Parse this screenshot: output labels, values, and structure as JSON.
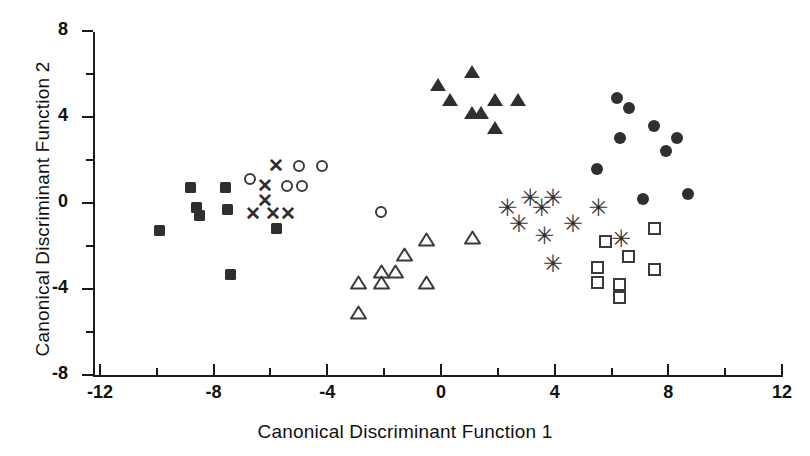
{
  "chart_data": {
    "type": "scatter",
    "title": "",
    "xlabel": "Canonical Discriminant Function 1",
    "ylabel": "Canonical Discriminant Function 2",
    "xlim": [
      -12,
      12
    ],
    "ylim": [
      -8,
      8
    ],
    "xticks": [
      -12,
      -8,
      -4,
      0,
      4,
      8,
      12
    ],
    "xticklabels": [
      "-12",
      "-8",
      "-4",
      "0",
      "4",
      "8",
      "12"
    ],
    "xminorticks": [
      -10,
      -6,
      -2,
      2,
      6,
      10
    ],
    "yticks": [
      8,
      4,
      0,
      -4,
      -8
    ],
    "yticklabels": [
      "8",
      "4",
      "0",
      "-4",
      "-8"
    ],
    "yminorticks": [
      6,
      2,
      -2,
      -6
    ],
    "grid": false,
    "legend": false,
    "series": [
      {
        "name": "Group 1",
        "marker": "filled-square",
        "points": [
          [
            -9.9,
            -1.3
          ],
          [
            -8.8,
            0.7
          ],
          [
            -8.6,
            -0.2
          ],
          [
            -8.5,
            -0.6
          ],
          [
            -7.6,
            0.7
          ],
          [
            -7.5,
            -0.3
          ],
          [
            -7.4,
            -3.3
          ],
          [
            -5.8,
            -1.2
          ]
        ]
      },
      {
        "name": "Group 2",
        "marker": "cross",
        "points": [
          [
            -5.8,
            1.7
          ],
          [
            -6.2,
            0.8
          ],
          [
            -6.2,
            0.1
          ],
          [
            -6.6,
            -0.5
          ],
          [
            -5.9,
            -0.5
          ],
          [
            -5.4,
            -0.5
          ]
        ]
      },
      {
        "name": "Group 3",
        "marker": "open-circle",
        "points": [
          [
            -5.0,
            1.7
          ],
          [
            -4.2,
            1.7
          ],
          [
            -6.7,
            1.1
          ],
          [
            -5.4,
            0.8
          ],
          [
            -4.9,
            0.8
          ],
          [
            -2.1,
            -0.4
          ]
        ]
      },
      {
        "name": "Group 4",
        "marker": "open-triangle",
        "points": [
          [
            -0.5,
            -1.7
          ],
          [
            1.1,
            -1.6
          ],
          [
            -1.3,
            -2.4
          ],
          [
            -2.1,
            -3.2
          ],
          [
            -1.6,
            -3.2
          ],
          [
            -2.9,
            -3.7
          ],
          [
            -2.1,
            -3.7
          ],
          [
            -0.5,
            -3.7
          ],
          [
            -2.9,
            -5.1
          ]
        ]
      },
      {
        "name": "Group 5",
        "marker": "filled-triangle",
        "points": [
          [
            1.1,
            6.1
          ],
          [
            -0.1,
            5.5
          ],
          [
            0.3,
            4.8
          ],
          [
            1.9,
            4.8
          ],
          [
            2.7,
            4.8
          ],
          [
            1.1,
            4.2
          ],
          [
            1.4,
            4.2
          ],
          [
            1.9,
            3.5
          ]
        ]
      },
      {
        "name": "Group 6",
        "marker": "asterisk",
        "points": [
          [
            2.3,
            -0.3
          ],
          [
            3.1,
            0.2
          ],
          [
            3.9,
            0.2
          ],
          [
            3.5,
            -0.3
          ],
          [
            2.7,
            -1.0
          ],
          [
            4.6,
            -1.0
          ],
          [
            3.6,
            -1.6
          ],
          [
            5.5,
            -0.3
          ],
          [
            3.9,
            -2.9
          ],
          [
            6.3,
            -1.7
          ]
        ]
      },
      {
        "name": "Group 7",
        "marker": "open-square",
        "points": [
          [
            7.5,
            -1.2
          ],
          [
            5.8,
            -1.8
          ],
          [
            6.6,
            -2.5
          ],
          [
            5.5,
            -3.0
          ],
          [
            7.5,
            -3.1
          ],
          [
            5.5,
            -3.7
          ],
          [
            6.3,
            -3.8
          ],
          [
            6.3,
            -4.4
          ]
        ]
      },
      {
        "name": "Group 8",
        "marker": "filled-circle",
        "points": [
          [
            6.2,
            4.9
          ],
          [
            6.6,
            4.4
          ],
          [
            7.5,
            3.6
          ],
          [
            6.3,
            3.0
          ],
          [
            8.3,
            3.0
          ],
          [
            7.9,
            2.4
          ],
          [
            5.5,
            1.6
          ],
          [
            7.1,
            0.2
          ],
          [
            8.7,
            0.4
          ]
        ]
      }
    ]
  },
  "axes": {
    "xlabel": "Canonical Discriminant Function 1",
    "ylabel": "Canonical Discriminant Function 2"
  }
}
